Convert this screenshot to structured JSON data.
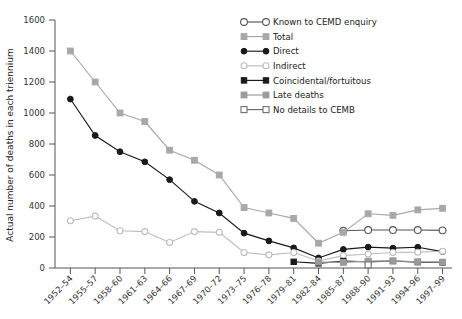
{
  "chart_data": {
    "type": "line",
    "title": "",
    "xlabel": "",
    "ylabel": "Actual number of deaths in each triennium",
    "ylim": [
      0,
      1600
    ],
    "yticks": [
      0,
      200,
      400,
      600,
      800,
      1000,
      1200,
      1400,
      1600
    ],
    "grid": false,
    "legend_position": "top-right",
    "categories": [
      "1952–54",
      "1955–57",
      "1958–60",
      "1961–63",
      "1964–66",
      "1967–69",
      "1970–72",
      "1973–75",
      "1976–78",
      "1979–81",
      "1982–84",
      "1985–87",
      "1988–90",
      "1991–93",
      "1994–96",
      "1997–99"
    ],
    "series": [
      {
        "name": "Known to CEMD enquiry",
        "marker": "circle-open-large",
        "color": "#555555",
        "fill": "#ffffff",
        "values": [
          null,
          null,
          null,
          null,
          null,
          null,
          null,
          null,
          null,
          null,
          null,
          240,
          245,
          245,
          245,
          243
        ]
      },
      {
        "name": "Total",
        "marker": "square-filled",
        "color": "#a8a8a8",
        "fill": "#a8a8a8",
        "values": [
          1400,
          1200,
          1000,
          945,
          760,
          695,
          600,
          390,
          355,
          320,
          160,
          230,
          350,
          340,
          375,
          385
        ]
      },
      {
        "name": "Direct",
        "marker": "circle-filled",
        "color": "#1a1a1a",
        "fill": "#1a1a1a",
        "values": [
          1090,
          855,
          750,
          685,
          570,
          430,
          355,
          225,
          175,
          130,
          65,
          120,
          135,
          128,
          134,
          106
        ]
      },
      {
        "name": "Indirect",
        "marker": "circle-open",
        "color": "#bdbdbd",
        "fill": "#ffffff",
        "values": [
          305,
          335,
          240,
          235,
          165,
          235,
          230,
          100,
          85,
          100,
          45,
          80,
          90,
          100,
          102,
          108
        ]
      },
      {
        "name": "Coincidental/fortuitous",
        "marker": "square-filled-small",
        "color": "#1a1a1a",
        "fill": "#1a1a1a",
        "values": [
          null,
          null,
          null,
          null,
          null,
          null,
          null,
          null,
          null,
          40,
          30,
          45,
          40,
          45,
          38,
          36
        ]
      },
      {
        "name": "Late deaths",
        "marker": "square-filled-grey",
        "color": "#9a9a9a",
        "fill": "#9a9a9a",
        "values": [
          null,
          null,
          null,
          null,
          null,
          null,
          null,
          null,
          null,
          null,
          38,
          36,
          44,
          46,
          40,
          38
        ]
      },
      {
        "name": "No details to CEMB",
        "marker": "square-open",
        "color": "#6e6e6e",
        "fill": "#ffffff",
        "values": [
          null,
          null,
          null,
          null,
          null,
          null,
          null,
          null,
          null,
          null,
          null,
          null,
          20,
          null,
          null,
          null
        ]
      }
    ],
    "legend_entries": [
      {
        "label": "Known to CEMD enquiry",
        "marker": "circle-open-large",
        "color": "#555555",
        "fill": "#ffffff"
      },
      {
        "label": "Total",
        "marker": "square-filled",
        "color": "#a8a8a8",
        "fill": "#a8a8a8"
      },
      {
        "label": "Direct",
        "marker": "circle-filled",
        "color": "#1a1a1a",
        "fill": "#1a1a1a"
      },
      {
        "label": "Indirect",
        "marker": "circle-open",
        "color": "#bdbdbd",
        "fill": "#ffffff"
      },
      {
        "label": "Coincidental/fortuitous",
        "marker": "square-filled-small",
        "color": "#1a1a1a",
        "fill": "#1a1a1a"
      },
      {
        "label": "Late deaths",
        "marker": "square-filled-grey",
        "color": "#9a9a9a",
        "fill": "#9a9a9a"
      },
      {
        "label": "No details to CEMB",
        "marker": "square-open",
        "color": "#6e6e6e",
        "fill": "#ffffff"
      }
    ]
  }
}
